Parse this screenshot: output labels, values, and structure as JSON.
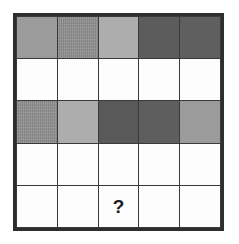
{
  "figure": {
    "background_color": "#ffffff",
    "grid_line_color": "#3a3a3a",
    "outer_border_color": "#2e2e2e",
    "rows": 5,
    "columns": 5
  },
  "palette": {
    "white": "#fdfdfd",
    "light_gray": "#adadad",
    "medium_gray": "#9b9b9b",
    "medium_dark_gray": "#8e8e8e",
    "dark_gray": "#5c5c5c",
    "darker_gray": "#585858"
  },
  "labels": {
    "question_mark": "?"
  },
  "chart_data": {
    "type": "heatmap",
    "xlabel": "",
    "ylabel": "",
    "grid": true,
    "legend": "none",
    "columns": [
      "c1",
      "c2",
      "c3",
      "c4",
      "c5"
    ],
    "rows": [
      "r1",
      "r2",
      "r3",
      "r4",
      "r5"
    ],
    "cells": [
      [
        {
          "shade": "medium_gray",
          "color": "#9b9b9b",
          "texture": "solid",
          "label": ""
        },
        {
          "shade": "medium_dark_gray",
          "color": "#8e8e8e",
          "texture": "dither",
          "label": ""
        },
        {
          "shade": "light_gray",
          "color": "#adadad",
          "texture": "solid",
          "label": ""
        },
        {
          "shade": "dark_gray",
          "color": "#5c5c5c",
          "texture": "solid",
          "label": ""
        },
        {
          "shade": "dark_gray",
          "color": "#5f5f5f",
          "texture": "solid",
          "label": ""
        }
      ],
      [
        {
          "shade": "white",
          "color": "#fdfdfd",
          "texture": "solid",
          "label": ""
        },
        {
          "shade": "white",
          "color": "#fdfdfd",
          "texture": "solid",
          "label": ""
        },
        {
          "shade": "white",
          "color": "#fdfdfd",
          "texture": "solid",
          "label": ""
        },
        {
          "shade": "white",
          "color": "#fdfdfd",
          "texture": "solid",
          "label": ""
        },
        {
          "shade": "white",
          "color": "#fdfdfd",
          "texture": "solid",
          "label": ""
        }
      ],
      [
        {
          "shade": "medium_dark_gray",
          "color": "#8e8e8e",
          "texture": "dither",
          "label": ""
        },
        {
          "shade": "light_gray",
          "color": "#adadad",
          "texture": "solid",
          "label": ""
        },
        {
          "shade": "dark_gray",
          "color": "#595959",
          "texture": "solid",
          "label": ""
        },
        {
          "shade": "dark_gray",
          "color": "#5e5e5e",
          "texture": "solid",
          "label": ""
        },
        {
          "shade": "medium_gray",
          "color": "#9b9b9b",
          "texture": "solid",
          "label": ""
        }
      ],
      [
        {
          "shade": "white",
          "color": "#fdfdfd",
          "texture": "solid",
          "label": ""
        },
        {
          "shade": "white",
          "color": "#fdfdfd",
          "texture": "solid",
          "label": ""
        },
        {
          "shade": "white",
          "color": "#fdfdfd",
          "texture": "solid",
          "label": ""
        },
        {
          "shade": "white",
          "color": "#fdfdfd",
          "texture": "solid",
          "label": ""
        },
        {
          "shade": "white",
          "color": "#fdfdfd",
          "texture": "solid",
          "label": ""
        }
      ],
      [
        {
          "shade": "white",
          "color": "#fdfdfd",
          "texture": "solid",
          "label": ""
        },
        {
          "shade": "white",
          "color": "#fdfdfd",
          "texture": "solid",
          "label": ""
        },
        {
          "shade": "white",
          "color": "#fdfdfd",
          "texture": "solid",
          "label": "?"
        },
        {
          "shade": "white",
          "color": "#fdfdfd",
          "texture": "solid",
          "label": ""
        },
        {
          "shade": "white",
          "color": "#fdfdfd",
          "texture": "solid",
          "label": ""
        }
      ]
    ]
  }
}
